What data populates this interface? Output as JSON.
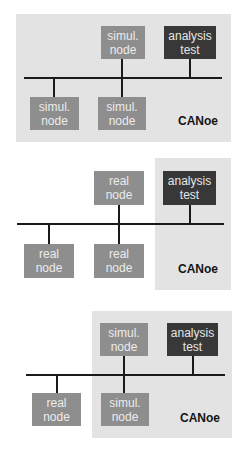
{
  "diagrams": [
    {
      "id": "all-simulated",
      "nodes": {
        "top_middle": {
          "line1": "simul.",
          "line2": "node"
        },
        "analysis": {
          "line1": "analysis",
          "line2": "test"
        },
        "bottom_left": {
          "line1": "simul.",
          "line2": "node"
        },
        "bottom_middle": {
          "line1": "simul.",
          "line2": "node"
        }
      },
      "label": "CANoe"
    },
    {
      "id": "all-real",
      "nodes": {
        "top_middle": {
          "line1": "real",
          "line2": "node"
        },
        "analysis": {
          "line1": "analysis",
          "line2": "test"
        },
        "bottom_left": {
          "line1": "real",
          "line2": "node"
        },
        "bottom_middle": {
          "line1": "real",
          "line2": "node"
        }
      },
      "label": "CANoe"
    },
    {
      "id": "mixed",
      "nodes": {
        "top_middle": {
          "line1": "simul.",
          "line2": "node"
        },
        "analysis": {
          "line1": "analysis",
          "line2": "test"
        },
        "bottom_left": {
          "line1": "real",
          "line2": "node"
        },
        "bottom_middle": {
          "line1": "simul.",
          "line2": "node"
        }
      },
      "label": "CANoe"
    }
  ],
  "colors": {
    "panel": "#e3e3e3",
    "node": "#8e8e8e",
    "analysis": "#383838",
    "bus": "#1a1a1a"
  }
}
